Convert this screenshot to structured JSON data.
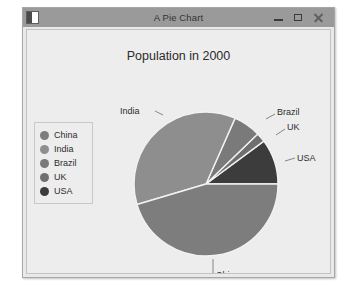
{
  "window": {
    "title": "A Pie Chart",
    "icon": "application-icon",
    "controls": [
      {
        "name": "minimize-button",
        "glyph": "minimize"
      },
      {
        "name": "maximize-button",
        "glyph": "maximize"
      },
      {
        "name": "close-button",
        "glyph": "close"
      }
    ]
  },
  "chart_data": {
    "type": "pie",
    "title": "Population in 2000",
    "xlabel": "",
    "ylabel": "",
    "categories": [
      "China",
      "India",
      "Brazil",
      "UK",
      "USA"
    ],
    "values": [
      1275,
      1017,
      172,
      59,
      285
    ],
    "slice_percent": [
      45.5,
      36.3,
      6.1,
      2.1,
      10.0
    ],
    "colors": [
      "#7d7d7d",
      "#8e8e8e",
      "#7a7a7a",
      "#6f6f6f",
      "#3c3c3c"
    ],
    "legend_position": "left",
    "grid": false,
    "labels": [
      "India",
      "Brazil",
      "UK",
      "USA",
      "China"
    ],
    "start_angle_deg": 0,
    "direction": "counterclockwise"
  },
  "legend": {
    "items": [
      {
        "label": "China",
        "color": "#7d7d7d"
      },
      {
        "label": "India",
        "color": "#8e8e8e"
      },
      {
        "label": "Brazil",
        "color": "#7a7a7a"
      },
      {
        "label": "UK",
        "color": "#6f6f6f"
      },
      {
        "label": "USA",
        "color": "#3c3c3c"
      }
    ]
  },
  "callouts": {
    "india": "India",
    "brazil": "Brazil",
    "uk": "UK",
    "usa": "USA",
    "china": "China"
  }
}
